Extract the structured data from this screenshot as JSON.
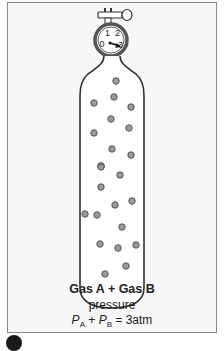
{
  "figure": {
    "gauge": {
      "labels": [
        "0",
        "1",
        "2",
        "3"
      ],
      "needle_points_to": "3",
      "unit_implied": "atm"
    },
    "caption": {
      "title": "Gas A + Gas B",
      "subtitle": "pressure",
      "equation": {
        "p_a_symbol": "P",
        "p_a_sub": "A",
        "plus": " + ",
        "p_b_symbol": "P",
        "p_b_sub": "B",
        "rhs": " = 3atm"
      }
    },
    "particle_count": 25,
    "colors": {
      "frame_border": "#8a8a8a",
      "frame_bg": "#f7f7f7",
      "outline": "#333333",
      "particle_fill": "#9a9a9a",
      "particle_stroke": "#555555"
    }
  }
}
